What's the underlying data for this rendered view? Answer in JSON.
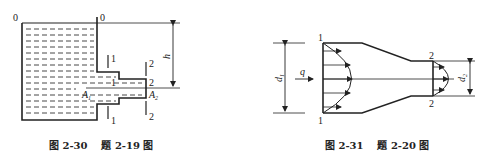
{
  "figure_left": {
    "caption": "图 2-30    题 2-19 图",
    "labels": {
      "datum_left": "0",
      "datum_right": "0",
      "height": "h",
      "section1_top": "1",
      "section1_mid": "1",
      "section1_bottom": "1",
      "section2_top": "2",
      "section2_mid": "2",
      "section2_bottom": "2",
      "area1": "A",
      "area1_sub": "1",
      "area2": "A",
      "area2_sub": "2"
    }
  },
  "figure_right": {
    "caption": "图 2-31    题 2-20 图",
    "labels": {
      "section1_top": "1",
      "section1_bottom": "1",
      "section2_top": "2",
      "section2_bottom": "2",
      "flow": "q",
      "diameter1": "d",
      "diameter1_sub": "1",
      "diameter2": "d",
      "diameter2_sub": "2"
    }
  },
  "colors": {
    "line": "#222222",
    "background": "#ffffff"
  }
}
